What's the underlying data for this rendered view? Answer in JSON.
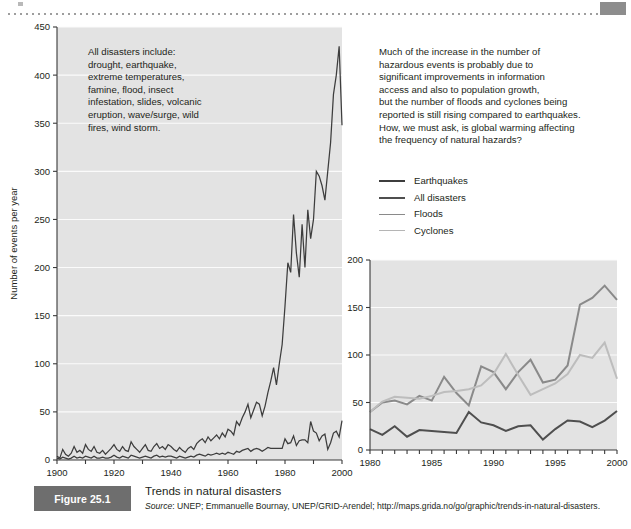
{
  "figure": {
    "badge": "Figure 25.1",
    "title": "Trends in natural disasters",
    "source_prefix": "Source",
    "source_text": ": UNEP; Emmanuelle Bournay, UNEP/GRID-Arendel; http://maps.grida.no/go/graphic/trends-in-natural-disasters."
  },
  "notes": {
    "left": "All disasters include:\ndrought, earthquake,\nextreme temperatures,\nfamine, flood, insect\ninfestation, slides, volcanic\neruption, wave/surge, wild\nfires, wind storm.",
    "right": "Much of the increase in the number of\nhazardous events is probably due to\nsignificant improvements in information\naccess and also to population growth,\nbut the number of floods and cyclones being\nreported is still rising compared to earthquakes.\nHow, we must ask, is global warming affecting\nthe frequency of natural hazards?"
  },
  "legend": {
    "position": "upper-right",
    "items": [
      {
        "label": "Earthquakes",
        "color": "#3d3d3d",
        "width": 2.0
      },
      {
        "label": "All disasters",
        "color": "#4f4f4f",
        "width": 2.4
      },
      {
        "label": "Floods",
        "color": "#8a8a8a",
        "width": 1.8
      },
      {
        "label": "Cyclones",
        "color": "#b5b5b5",
        "width": 1.6
      }
    ]
  },
  "colors": {
    "plot_background": "#e3e3e3",
    "gridline": "#fbfbfb",
    "axis": "#3a3a3a",
    "badge_background": "#6e6e6e",
    "text": "#231f20"
  },
  "chart_data": [
    {
      "id": "main",
      "type": "line",
      "title": "",
      "xlabel": "",
      "ylabel": "Number of events per year",
      "xlim": [
        1900,
        2000
      ],
      "ylim": [
        0,
        450
      ],
      "xticks": [
        1900,
        1910,
        1920,
        1930,
        1940,
        1950,
        1960,
        1970,
        1980,
        1990,
        2000
      ],
      "xticklabels": [
        "1900",
        "",
        "1920",
        "",
        "1940",
        "",
        "1960",
        "",
        "1980",
        "",
        "2000"
      ],
      "yticks": [
        0,
        50,
        100,
        150,
        200,
        250,
        300,
        350,
        400,
        450
      ],
      "yticklabels": [
        "0",
        "50",
        "100",
        "150",
        "200",
        "250",
        "300",
        "350",
        "400",
        "450"
      ],
      "grid": true,
      "x": [
        1900,
        1901,
        1902,
        1903,
        1904,
        1905,
        1906,
        1907,
        1908,
        1909,
        1910,
        1911,
        1912,
        1913,
        1914,
        1915,
        1916,
        1917,
        1918,
        1919,
        1920,
        1921,
        1922,
        1923,
        1924,
        1925,
        1926,
        1927,
        1928,
        1929,
        1930,
        1931,
        1932,
        1933,
        1934,
        1935,
        1936,
        1937,
        1938,
        1939,
        1940,
        1941,
        1942,
        1943,
        1944,
        1945,
        1946,
        1947,
        1948,
        1949,
        1950,
        1951,
        1952,
        1953,
        1954,
        1955,
        1956,
        1957,
        1958,
        1959,
        1960,
        1961,
        1962,
        1963,
        1964,
        1965,
        1966,
        1967,
        1968,
        1969,
        1970,
        1971,
        1972,
        1973,
        1974,
        1975,
        1976,
        1977,
        1978,
        1979,
        1980,
        1981,
        1982,
        1983,
        1984,
        1985,
        1986,
        1987,
        1988,
        1989,
        1990,
        1991,
        1992,
        1993,
        1994,
        1995,
        1996,
        1997,
        1998,
        1999,
        2000
      ],
      "series": [
        {
          "name": "All disasters",
          "color": "#3d3d3d",
          "width": 1.25,
          "values": [
            4,
            2,
            11,
            6,
            4,
            7,
            14,
            8,
            10,
            7,
            16,
            11,
            9,
            14,
            8,
            7,
            10,
            6,
            9,
            12,
            16,
            11,
            9,
            14,
            10,
            9,
            19,
            14,
            11,
            8,
            12,
            16,
            10,
            9,
            14,
            17,
            12,
            14,
            11,
            16,
            14,
            11,
            9,
            13,
            10,
            8,
            12,
            14,
            11,
            17,
            20,
            22,
            18,
            24,
            20,
            23,
            26,
            22,
            28,
            24,
            32,
            30,
            26,
            40,
            36,
            44,
            50,
            58,
            44,
            52,
            60,
            58,
            46,
            56,
            70,
            82,
            96,
            78,
            100,
            120,
            160,
            205,
            195,
            255,
            215,
            190,
            245,
            200,
            260,
            230,
            250,
            300,
            295,
            285,
            270,
            300,
            330,
            380,
            400,
            430,
            348
          ]
        },
        {
          "name": "Earthquakes",
          "color": "#3d3d3d",
          "width": 1.25,
          "values": [
            2,
            1,
            3,
            2,
            1,
            2,
            4,
            2,
            3,
            2,
            4,
            3,
            2,
            4,
            2,
            2,
            3,
            2,
            2,
            3,
            5,
            3,
            2,
            4,
            3,
            2,
            5,
            4,
            3,
            2,
            3,
            4,
            3,
            2,
            4,
            5,
            3,
            4,
            3,
            4,
            4,
            3,
            2,
            4,
            3,
            2,
            3,
            4,
            3,
            5,
            6,
            5,
            4,
            6,
            5,
            6,
            7,
            6,
            7,
            6,
            8,
            7,
            6,
            9,
            8,
            10,
            11,
            12,
            9,
            11,
            12,
            11,
            9,
            11,
            13,
            12,
            12,
            12,
            12,
            12,
            22,
            17,
            18,
            25,
            15,
            20,
            21,
            21,
            18,
            40,
            30,
            28,
            20,
            25,
            27,
            11,
            18,
            28,
            30,
            24,
            41
          ]
        }
      ]
    },
    {
      "id": "inset",
      "type": "line",
      "title": "",
      "xlabel": "",
      "ylabel": "",
      "xlim": [
        1980,
        2000
      ],
      "ylim": [
        0,
        200
      ],
      "xticks": [
        1980,
        1981,
        1982,
        1983,
        1984,
        1985,
        1986,
        1987,
        1988,
        1989,
        1990,
        1991,
        1992,
        1993,
        1994,
        1995,
        1996,
        1997,
        1998,
        1999,
        2000
      ],
      "xticklabels": [
        "1980",
        "",
        "",
        "",
        "",
        "1985",
        "",
        "",
        "",
        "",
        "1990",
        "",
        "",
        "",
        "",
        "1995",
        "",
        "",
        "",
        "",
        "2000"
      ],
      "yticks": [
        0,
        50,
        100,
        150,
        200
      ],
      "yticklabels": [
        "0",
        "50",
        "100",
        "150",
        "200"
      ],
      "grid": true,
      "x": [
        1980,
        1981,
        1982,
        1983,
        1984,
        1985,
        1986,
        1987,
        1988,
        1989,
        1990,
        1991,
        1992,
        1993,
        1994,
        1995,
        1996,
        1997,
        1998,
        1999,
        2000
      ],
      "series": [
        {
          "name": "Earthquakes",
          "color": "#4f4f4f",
          "width": 2.0,
          "values": [
            22,
            16,
            25,
            14,
            21,
            20,
            19,
            18,
            40,
            29,
            26,
            20,
            25,
            26,
            11,
            22,
            31,
            30,
            24,
            31,
            41
          ]
        },
        {
          "name": "Floods",
          "color": "#8a8a8a",
          "width": 2.0,
          "values": [
            40,
            50,
            52,
            48,
            57,
            52,
            77,
            60,
            47,
            88,
            82,
            64,
            82,
            95,
            71,
            74,
            89,
            153,
            160,
            173,
            158
          ]
        },
        {
          "name": "Cyclones",
          "color": "#bdbdbd",
          "width": 2.0,
          "values": [
            40,
            51,
            56,
            55,
            54,
            57,
            61,
            62,
            64,
            68,
            80,
            101,
            79,
            58,
            64,
            70,
            80,
            100,
            97,
            113,
            75
          ]
        }
      ]
    }
  ]
}
